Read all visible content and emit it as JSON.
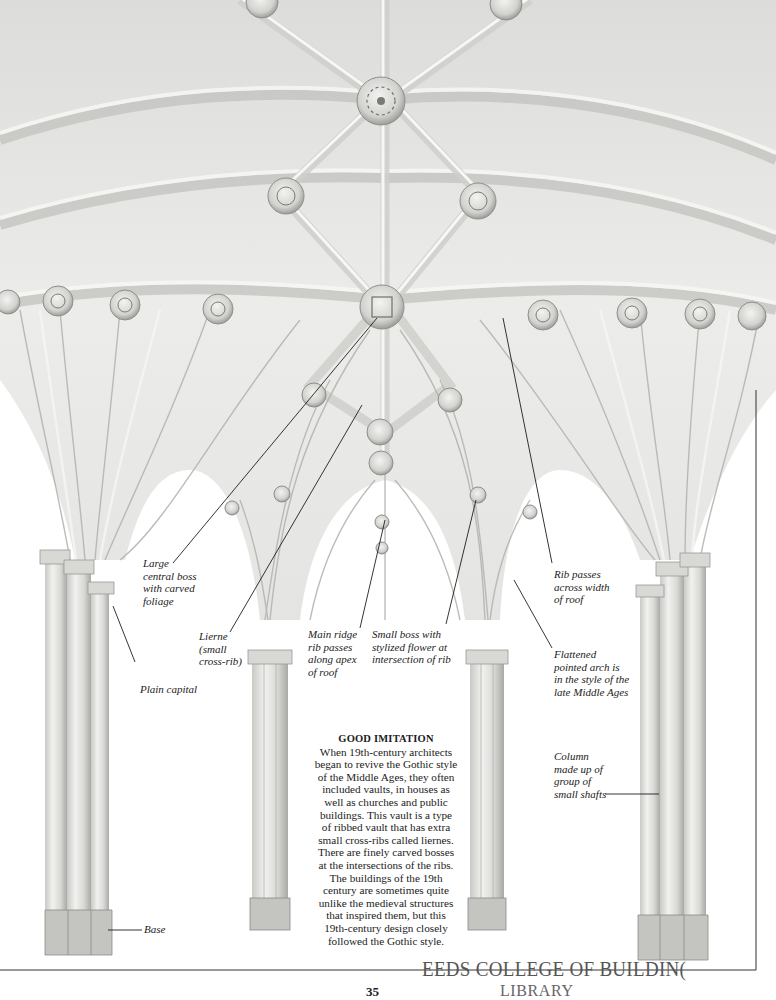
{
  "page": {
    "number": "35",
    "stamp": {
      "line1": "LEEDS COLLEGE OF BUILDING",
      "line1_visible": "EEDS COLLEGE OF BUILDIN(",
      "line2": "LIBRARY"
    }
  },
  "illustration": {
    "subject": "Nineteenth-century Gothic-style lierne vault ceiling with clustered columns",
    "colors": {
      "stone": "#e9e9e7",
      "stone_shadow": "#b9b9b6",
      "stone_dark": "#8f8f8c",
      "ink": "#1e1e1e",
      "page": "#ffffff"
    }
  },
  "annotations": [
    {
      "id": "large-central-boss",
      "text": "Large\ncentral boss\nwith carved\nfoliage"
    },
    {
      "id": "lierne",
      "text": "Lierne\n(small\ncross-rib)"
    },
    {
      "id": "plain-capital",
      "text": "Plain capital"
    },
    {
      "id": "main-ridge-rib",
      "text": "Main ridge\nrib passes\nalong apex\nof roof"
    },
    {
      "id": "small-boss",
      "text": "Small boss with\nstylized flower at\nintersection of rib"
    },
    {
      "id": "rib-passes",
      "text": "Rib passes\nacross width\nof roof"
    },
    {
      "id": "flattened-arch",
      "text": "Flattened\npointed arch is\nin the style of the\nlate Middle Ages"
    },
    {
      "id": "column",
      "text": "Column\nmade up of\ngroup of\nsmall shafts"
    },
    {
      "id": "base",
      "text": "Base"
    }
  ],
  "caption": {
    "title": "GOOD IMITATION",
    "body": "When 19th-century architects\nbegan to revive the Gothic style\nof the Middle Ages, they often\nincluded vaults, in houses as\nwell as churches and public\nbuildings. This vault is a type\nof ribbed vault that has extra\nsmall cross-ribs called liernes.\nThere are finely carved bosses\nat the intersections of the ribs.\nThe buildings of the 19th\ncentury are sometimes quite\nunlike the medieval structures\nthat inspired them, but this\n19th-century design closely\nfollowed the Gothic style."
  }
}
